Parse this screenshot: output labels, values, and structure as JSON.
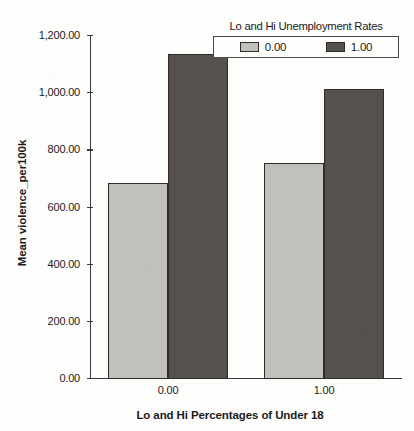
{
  "chart_data": {
    "type": "bar",
    "title": "",
    "xlabel": "Lo and Hi Percentages of Under 18",
    "ylabel": "Mean violence_per100k",
    "categories": [
      "0.00",
      "1.00"
    ],
    "series": [
      {
        "name": "0.00",
        "values": [
          685,
          757
        ],
        "color": "#c2c0bc"
      },
      {
        "name": "1.00",
        "values": [
          1136,
          1014
        ],
        "color": "#57514e"
      }
    ],
    "legend": {
      "title": "Lo and Hi Unemployment Rates",
      "position": "top-right",
      "entries": [
        "0.00",
        "1.00"
      ]
    },
    "ylim": [
      0,
      1200
    ],
    "yticks": [
      0,
      200,
      400,
      600,
      800,
      1000,
      1200
    ],
    "ytick_labels": [
      "0.00",
      "200.00",
      "400.00",
      "600.00",
      "800.00",
      "1,000.00",
      "1,200.00"
    ],
    "xtick_labels": [
      "0.00",
      "1.00"
    ],
    "grid": false,
    "background_color": "#fdfdfb",
    "axis_color": "#3a3a3a"
  }
}
